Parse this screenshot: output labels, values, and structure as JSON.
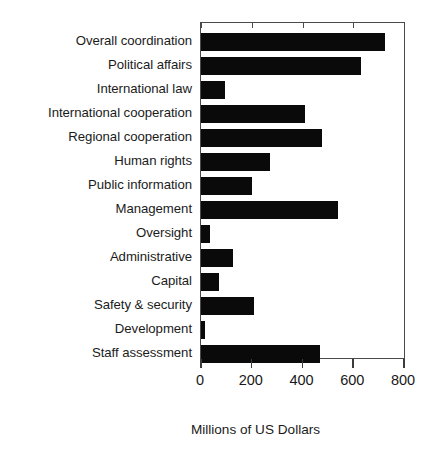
{
  "chart_data": {
    "type": "bar",
    "orientation": "horizontal",
    "title": "",
    "xlabel": "Millions of US Dollars",
    "ylabel": "",
    "xlim": [
      0,
      800
    ],
    "xticks": [
      0,
      200,
      400,
      600,
      800
    ],
    "grid": false,
    "legend": null,
    "bar_color": "#0a0a0a",
    "categories": [
      "Overall coordination",
      "Political affairs",
      "International law",
      "International cooperation",
      "Regional cooperation",
      "Human rights",
      "Public information",
      "Management",
      "Oversight",
      "Administrative",
      "Capital",
      "Safety & security",
      "Development",
      "Staff assessment"
    ],
    "values": [
      725,
      630,
      95,
      410,
      477,
      272,
      201,
      540,
      35,
      126,
      71,
      209,
      16,
      469
    ]
  }
}
